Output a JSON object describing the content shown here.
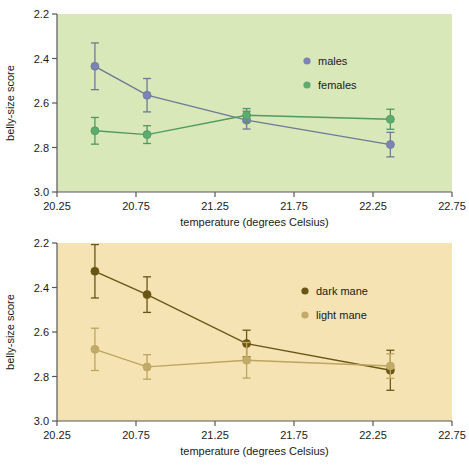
{
  "figure": {
    "background_color": "#ffffff",
    "panels": [
      "top",
      "bottom"
    ]
  },
  "chart_data": [
    {
      "id": "top",
      "type": "line",
      "title": "",
      "xlabel": "temperature (degrees Celsius)",
      "ylabel": "belly-size score",
      "xlim": [
        20.25,
        22.75
      ],
      "ylim": [
        2.2,
        3.0
      ],
      "y_inverted": true,
      "grid": false,
      "plot_background": "#d8e8b8",
      "legend_position": "upper right",
      "xticks": [
        20.25,
        20.75,
        21.25,
        21.75,
        22.25,
        22.75
      ],
      "xticklabels": [
        "20.25",
        "20.75",
        "21.25",
        "21.75",
        "22.25",
        "22.75"
      ],
      "yticks": [
        2.2,
        2.4,
        2.6,
        2.8,
        3.0
      ],
      "yticklabels": [
        "2.2",
        "2.4",
        "2.6",
        "2.8",
        "3.0"
      ],
      "x": [
        20.49,
        20.82,
        21.45,
        22.36
      ],
      "series": [
        {
          "name": "males",
          "color": "#7b84b4",
          "line_color": "#6e7a95",
          "values": [
            2.435,
            2.565,
            2.677,
            2.787
          ],
          "err_low": [
            0.105,
            0.075,
            0.04,
            0.055
          ],
          "err_high": [
            0.105,
            0.075,
            0.04,
            0.055
          ]
        },
        {
          "name": "females",
          "color": "#5faa6e",
          "line_color": "#4f9a5f",
          "values": [
            2.725,
            2.742,
            2.655,
            2.673
          ],
          "err_low": [
            0.06,
            0.04,
            0.03,
            0.045
          ],
          "err_high": [
            0.06,
            0.04,
            0.03,
            0.045
          ]
        }
      ]
    },
    {
      "id": "bottom",
      "type": "line",
      "title": "",
      "xlabel": "temperature (degrees Celsius)",
      "ylabel": "belly-size score",
      "xlim": [
        20.25,
        22.75
      ],
      "ylim": [
        2.2,
        3.0
      ],
      "y_inverted": true,
      "grid": false,
      "plot_background": "#f5e3b4",
      "legend_position": "upper right",
      "xticks": [
        20.25,
        20.75,
        21.25,
        21.75,
        22.25,
        22.75
      ],
      "xticklabels": [
        "20.25",
        "20.75",
        "21.25",
        "21.75",
        "22.25",
        "22.75"
      ],
      "yticks": [
        2.2,
        2.4,
        2.6,
        2.8,
        3.0
      ],
      "yticklabels": [
        "2.2",
        "2.4",
        "2.6",
        "2.8",
        "3.0"
      ],
      "x": [
        20.49,
        20.82,
        21.45,
        22.36
      ],
      "series": [
        {
          "name": "dark mane",
          "color": "#6b5516",
          "line_color": "#6b5516",
          "values": [
            2.327,
            2.432,
            2.652,
            2.772
          ],
          "err_low": [
            0.12,
            0.08,
            0.06,
            0.09
          ],
          "err_high": [
            0.12,
            0.08,
            0.06,
            0.09
          ]
        },
        {
          "name": "light mane",
          "color": "#c2ab6a",
          "line_color": "#bda55f",
          "values": [
            2.678,
            2.757,
            2.727,
            2.753
          ],
          "err_low": [
            0.095,
            0.055,
            0.08,
            0.055
          ],
          "err_high": [
            0.095,
            0.055,
            0.08,
            0.055
          ]
        }
      ]
    }
  ]
}
